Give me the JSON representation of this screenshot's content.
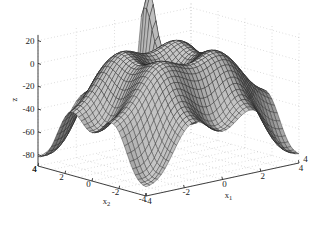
{
  "figure": {
    "type": "surface-plot-3d",
    "background_color": "#ffffff",
    "mesh_color": "#1f1f1f",
    "face_color_light": "#f2f2f2",
    "face_color_dark": "#4d4d4d",
    "grid_color": "#b0b0b0",
    "axis_color": "#2a2a2a"
  },
  "axes": {
    "z": {
      "label": "z",
      "ticks": [
        "20",
        "0",
        "-20",
        "-40",
        "-60",
        "-80"
      ],
      "tick_values": [
        20,
        0,
        -20,
        -40,
        -60,
        -80
      ],
      "range": [
        -90,
        25
      ]
    },
    "x1": {
      "label": "x1",
      "label_base": "x",
      "label_sub": "1",
      "ticks": [
        "-4",
        "-2",
        "0",
        "2",
        "4"
      ],
      "tick_values": [
        -4,
        -2,
        0,
        2,
        4
      ],
      "range": [
        -4,
        4
      ]
    },
    "x2": {
      "label": "x2",
      "label_base": "x",
      "label_sub": "2",
      "ticks": [
        "4",
        "2",
        "0",
        "-2",
        "-4"
      ],
      "tick_values": [
        4,
        2,
        0,
        -2,
        -4
      ],
      "range": [
        -4,
        4
      ]
    }
  },
  "chart_data": {
    "type": "surface",
    "title": "",
    "xlabel": "x1",
    "ylabel": "x2",
    "zlabel": "z",
    "xlim": [
      -4,
      4
    ],
    "ylim": [
      -4,
      4
    ],
    "zlim": [
      -90,
      25
    ],
    "grid": true,
    "legend": false,
    "colormap": "gray",
    "shading": "faceted-mesh",
    "formula": "z = (x1^2 - 10*cos(2*pi*x1)) + (x2^2 - 10*cos(2*pi*x2)) - 4*(x1^2 + x2^2) ",
    "grid_resolution": {
      "nx": 41,
      "ny": 41
    },
    "z_min_observed": -85,
    "z_max_observed": 22,
    "view": {
      "azimuth": -37.5,
      "elevation": 30
    },
    "x": [
      -4,
      -3.6,
      -3.2,
      -2.8,
      -2.4,
      -2,
      -1.6,
      -1.2,
      -0.8,
      -0.4,
      0,
      0.4,
      0.8,
      1.2,
      1.6,
      2,
      2.4,
      2.8,
      3.2,
      3.6,
      4
    ],
    "y": [
      -4,
      -3.6,
      -3.2,
      -2.8,
      -2.4,
      -2,
      -1.6,
      -1.2,
      -0.8,
      -0.4,
      0,
      0.4,
      0.8,
      1.2,
      1.6,
      2,
      2.4,
      2.8,
      3.2,
      3.6,
      4
    ]
  }
}
